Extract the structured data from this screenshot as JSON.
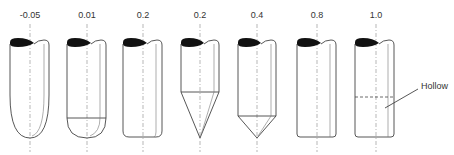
{
  "diagram": {
    "type": "nose-shape-comparison",
    "columns": [
      {
        "label": "-0.05",
        "shape": "elliptical-long",
        "center_x": 30
      },
      {
        "label": "0.01",
        "shape": "hemispherical",
        "center_x": 87
      },
      {
        "label": "0.2",
        "shape": "flat-rounded",
        "center_x": 143
      },
      {
        "label": "0.2",
        "shape": "long-cone",
        "center_x": 200
      },
      {
        "label": "0.4",
        "shape": "short-cone",
        "center_x": 257
      },
      {
        "label": "0.8",
        "shape": "flat",
        "center_x": 317
      },
      {
        "label": "1.0",
        "shape": "hollow",
        "center_x": 376
      }
    ],
    "annotation": {
      "text": "Hollow"
    },
    "colors": {
      "outline": "#444444",
      "cap": "#111111",
      "axis": "#888888",
      "text": "#333333"
    }
  }
}
